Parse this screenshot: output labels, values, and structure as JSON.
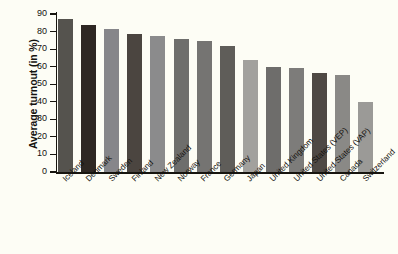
{
  "chart_data": {
    "type": "bar",
    "title": "",
    "subtitle": "",
    "xlabel": "",
    "ylabel": "Average turnout (in %)",
    "ylim": [
      0,
      90
    ],
    "ytick_step": 10,
    "yticks": [
      "0",
      "10",
      "20",
      "30",
      "40",
      "50",
      "60",
      "70",
      "80",
      "90"
    ],
    "grid": false,
    "legend": "none",
    "categories": [
      "Iceland",
      "Denmark",
      "Sweden",
      "Finland",
      "New Zealand",
      "Norway",
      "France",
      "Germany",
      "Japan",
      "United Kingdom",
      "United States (VEP)",
      "United States (VAP)",
      "Canada",
      "Switzerland"
    ],
    "values": [
      87,
      84,
      81.5,
      78.5,
      77.5,
      76,
      74.5,
      72,
      64,
      60,
      59,
      56.5,
      55,
      40
    ],
    "bar_colors": [
      "#55534e",
      "#2e2723",
      "#86868a",
      "#4b4540",
      "#8b8b8c",
      "#6e6e6c",
      "#757472",
      "#5f5d59",
      "#a2a19d",
      "#6e6d6b",
      "#7d7c7a",
      "#4f4944",
      "#8a8986",
      "#9b9a97"
    ]
  },
  "axis": {
    "ylabel": "Average turnout (in %)"
  },
  "colors": {
    "background": "#fdfdf5",
    "axis": "#17150f",
    "text": "#14120f"
  }
}
